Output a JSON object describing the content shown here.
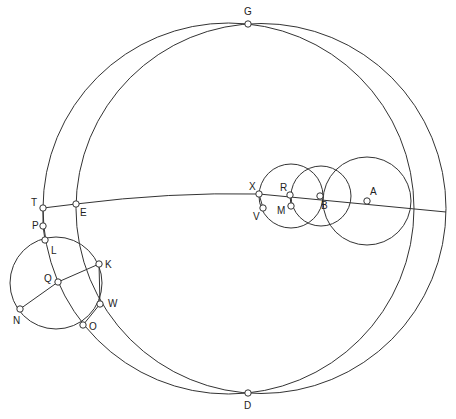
{
  "diagram": {
    "title": "",
    "stroke_color": "#333333",
    "background": "#ffffff",
    "points": [
      {
        "id": "G",
        "label": "G",
        "x": 248,
        "y": 24,
        "lx": 244,
        "ly": 15
      },
      {
        "id": "D",
        "label": "D",
        "x": 248,
        "y": 393,
        "lx": 244,
        "ly": 409
      },
      {
        "id": "T",
        "label": "T",
        "x": 43,
        "y": 208,
        "lx": 31,
        "ly": 206
      },
      {
        "id": "E",
        "label": "E",
        "x": 76,
        "y": 204,
        "lx": 80,
        "ly": 216
      },
      {
        "id": "P",
        "label": "P",
        "x": 43,
        "y": 226,
        "lx": 32,
        "ly": 229
      },
      {
        "id": "L",
        "label": "L",
        "x": 45,
        "y": 240,
        "lx": 51,
        "ly": 254
      },
      {
        "id": "K",
        "label": "K",
        "x": 99,
        "y": 264,
        "lx": 105,
        "ly": 268
      },
      {
        "id": "Q",
        "label": "Q",
        "x": 58,
        "y": 282,
        "lx": 44,
        "ly": 282
      },
      {
        "id": "N",
        "label": "N",
        "x": 20,
        "y": 309,
        "lx": 13,
        "ly": 324
      },
      {
        "id": "W",
        "label": "W",
        "x": 100,
        "y": 304,
        "lx": 108,
        "ly": 307
      },
      {
        "id": "O",
        "label": "O",
        "x": 83,
        "y": 325,
        "lx": 89,
        "ly": 330
      },
      {
        "id": "X",
        "label": "X",
        "x": 259,
        "y": 194,
        "lx": 249,
        "ly": 190
      },
      {
        "id": "V",
        "label": "V",
        "x": 263,
        "y": 208,
        "lx": 253,
        "ly": 220
      },
      {
        "id": "R",
        "label": "R",
        "x": 290,
        "y": 195,
        "lx": 280,
        "ly": 191
      },
      {
        "id": "M",
        "label": "M",
        "x": 291,
        "y": 206,
        "lx": 277,
        "ly": 214
      },
      {
        "id": "B",
        "label": "B",
        "x": 320,
        "y": 196,
        "lx": 321,
        "ly": 209
      },
      {
        "id": "A",
        "label": "A",
        "x": 367,
        "y": 201,
        "lx": 370,
        "ly": 195
      }
    ],
    "circles": [
      {
        "id": "big-left",
        "cx": 228.5,
        "cy": 208.5,
        "r": 185.5
      },
      {
        "id": "big-right",
        "cx": 261,
        "cy": 208.5,
        "r": 185
      },
      {
        "id": "small-xr",
        "cx": 291,
        "cy": 196,
        "r": 32
      },
      {
        "id": "small-rb",
        "cx": 321,
        "cy": 196,
        "r": 30
      },
      {
        "id": "large-a",
        "cx": 367,
        "cy": 201,
        "r": 44
      },
      {
        "id": "lower-left",
        "cx": 56,
        "cy": 283,
        "r": 46
      }
    ],
    "lines": [
      {
        "id": "line-TE",
        "d": "M43,208 L76,204"
      },
      {
        "id": "line-E-to-right",
        "d": "M76,204 Q170,192 259,194 L446,212"
      },
      {
        "id": "line-NK",
        "d": "M20,309 L58,282 L99,264"
      },
      {
        "id": "line-TPL",
        "d": "M43,208 L43,226 L45,240"
      },
      {
        "id": "line-KW",
        "d": "M99,264 L100,304"
      },
      {
        "id": "line-WO",
        "d": "M100,304 L83,325"
      },
      {
        "id": "line-XV",
        "d": "M259,194 L263,208"
      },
      {
        "id": "line-RM",
        "d": "M290,195 L291,206"
      }
    ]
  }
}
